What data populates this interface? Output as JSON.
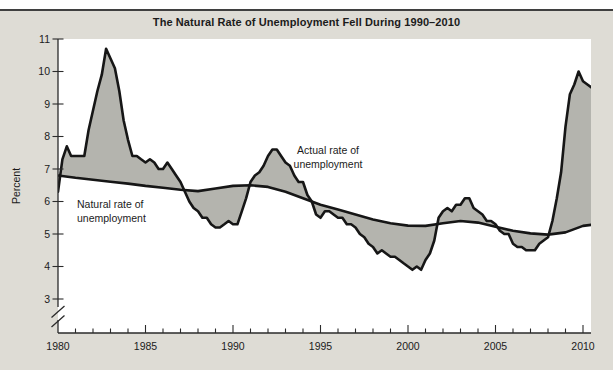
{
  "figure": {
    "title": "The Natural Rate of Unemployment Fell During 1990–2010",
    "ylabel": "Percent",
    "annotation_actual": "Actual rate of\nunemployment",
    "annotation_natural": "Natural rate of\nunemployment"
  },
  "colors": {
    "panel_bg": "#dedcd5",
    "plot_bg": "#ffffff",
    "area_fill": "#b4b4ae",
    "line": "#161616",
    "axis": "#2b2b2b",
    "text": "#1b1b1b",
    "top_rule": "#3f3f3f"
  },
  "chart_data": {
    "type": "line",
    "title": "The Natural Rate of Unemployment Fell During 1990–2010",
    "xlabel": "",
    "ylabel": "Percent",
    "x_ticks": [
      1980,
      1985,
      1990,
      1995,
      2000,
      2005,
      2010
    ],
    "y_ticks": [
      11,
      10,
      9,
      8,
      7,
      6,
      5,
      4,
      3
    ],
    "xlim": [
      1980,
      2010.9
    ],
    "ylim": [
      3,
      11
    ],
    "y_axis_break_below": 3,
    "grid": false,
    "legend_position": "inline-annotations",
    "shaded": "gray area fills the gap between actual and natural rate curves",
    "series": [
      {
        "name": "Actual rate of unemployment",
        "x_start": 1980.0,
        "x_step": 0.25,
        "values": [
          6.3,
          7.3,
          7.7,
          7.4,
          7.4,
          7.4,
          7.4,
          8.2,
          8.8,
          9.4,
          9.9,
          10.7,
          10.4,
          10.1,
          9.4,
          8.5,
          7.9,
          7.4,
          7.4,
          7.3,
          7.2,
          7.3,
          7.2,
          7.0,
          7.0,
          7.2,
          7.0,
          6.8,
          6.6,
          6.3,
          6.0,
          5.8,
          5.7,
          5.5,
          5.5,
          5.3,
          5.2,
          5.2,
          5.3,
          5.4,
          5.3,
          5.3,
          5.7,
          6.1,
          6.6,
          6.8,
          6.9,
          7.1,
          7.4,
          7.6,
          7.6,
          7.4,
          7.2,
          7.1,
          6.8,
          6.6,
          6.6,
          6.2,
          6.0,
          5.6,
          5.5,
          5.7,
          5.7,
          5.6,
          5.5,
          5.5,
          5.3,
          5.3,
          5.2,
          5.0,
          4.9,
          4.7,
          4.6,
          4.4,
          4.5,
          4.4,
          4.3,
          4.3,
          4.2,
          4.1,
          4.0,
          3.9,
          4.0,
          3.9,
          4.2,
          4.4,
          4.8,
          5.5,
          5.7,
          5.8,
          5.7,
          5.9,
          5.9,
          6.1,
          6.1,
          5.8,
          5.7,
          5.6,
          5.4,
          5.4,
          5.3,
          5.1,
          5.0,
          5.0,
          4.7,
          4.6,
          4.6,
          4.5,
          4.5,
          4.5,
          4.7,
          4.8,
          4.9,
          5.4,
          6.1,
          6.9,
          8.3,
          9.3,
          9.6,
          10.0,
          9.7,
          9.6,
          9.5,
          9.6
        ]
      },
      {
        "name": "Natural rate of unemployment",
        "x": [
          1980,
          1981,
          1982,
          1983,
          1984,
          1985,
          1986,
          1987,
          1988,
          1989,
          1990,
          1991,
          1992,
          1993,
          1994,
          1995,
          1996,
          1997,
          1998,
          1999,
          2000,
          2001,
          2002,
          2003,
          2004,
          2005,
          2006,
          2007,
          2008,
          2009,
          2010,
          2010.75
        ],
        "values": [
          6.8,
          6.73,
          6.67,
          6.61,
          6.55,
          6.48,
          6.42,
          6.36,
          6.32,
          6.4,
          6.48,
          6.5,
          6.45,
          6.3,
          6.1,
          5.9,
          5.75,
          5.6,
          5.45,
          5.33,
          5.26,
          5.25,
          5.33,
          5.4,
          5.35,
          5.22,
          5.1,
          5.02,
          4.98,
          5.05,
          5.25,
          5.3
        ]
      }
    ]
  }
}
